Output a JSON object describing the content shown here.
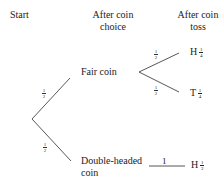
{
  "headers": {
    "start": "Start",
    "after_choice_line1": "After coin",
    "after_choice_line2": "choice",
    "after_toss_line1": "After coin",
    "after_toss_line2": "toss"
  },
  "nodes": {
    "fair": "Fair coin",
    "double_line1": "Double-headed",
    "double_line2": "coin"
  },
  "branch_probs": {
    "start_to_fair": {
      "num": "1",
      "den": "2"
    },
    "start_to_double": {
      "num": "1",
      "den": "2"
    },
    "fair_to_h": {
      "num": "1",
      "den": "2"
    },
    "fair_to_t": {
      "num": "1",
      "den": "2"
    },
    "double_to_h": "1"
  },
  "outcomes": {
    "fair_h": {
      "label": "H",
      "num": "1",
      "den": "4"
    },
    "fair_t": {
      "label": "T",
      "num": "1",
      "den": "4"
    },
    "double_h": {
      "label": "H",
      "num": "1",
      "den": "2"
    }
  }
}
